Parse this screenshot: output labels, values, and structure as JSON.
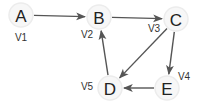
{
  "diagram": {
    "type": "directed-graph",
    "nodes": [
      {
        "id": "A",
        "label": "A",
        "vlabel": "V1",
        "x": 21,
        "y": 15,
        "lx": 21,
        "ly": 37
      },
      {
        "id": "B",
        "label": "B",
        "vlabel": "V2",
        "x": 99,
        "y": 17,
        "lx": 87,
        "ly": 34
      },
      {
        "id": "C",
        "label": "C",
        "vlabel": "V3",
        "x": 176,
        "y": 19,
        "lx": 154,
        "ly": 28
      },
      {
        "id": "D",
        "label": "D",
        "vlabel": "V5",
        "x": 110,
        "y": 88,
        "lx": 87,
        "ly": 86
      },
      {
        "id": "E",
        "label": "E",
        "vlabel": "V4",
        "x": 167,
        "y": 88,
        "lx": 184,
        "ly": 76
      }
    ],
    "edges": [
      {
        "from": "A",
        "to": "B"
      },
      {
        "from": "B",
        "to": "C"
      },
      {
        "from": "C",
        "to": "D"
      },
      {
        "from": "C",
        "to": "E"
      },
      {
        "from": "E",
        "to": "D"
      },
      {
        "from": "D",
        "to": "B"
      }
    ],
    "colors": {
      "edge": "#555555",
      "node_fill": "#f7f7f7",
      "text": "#222222"
    }
  }
}
